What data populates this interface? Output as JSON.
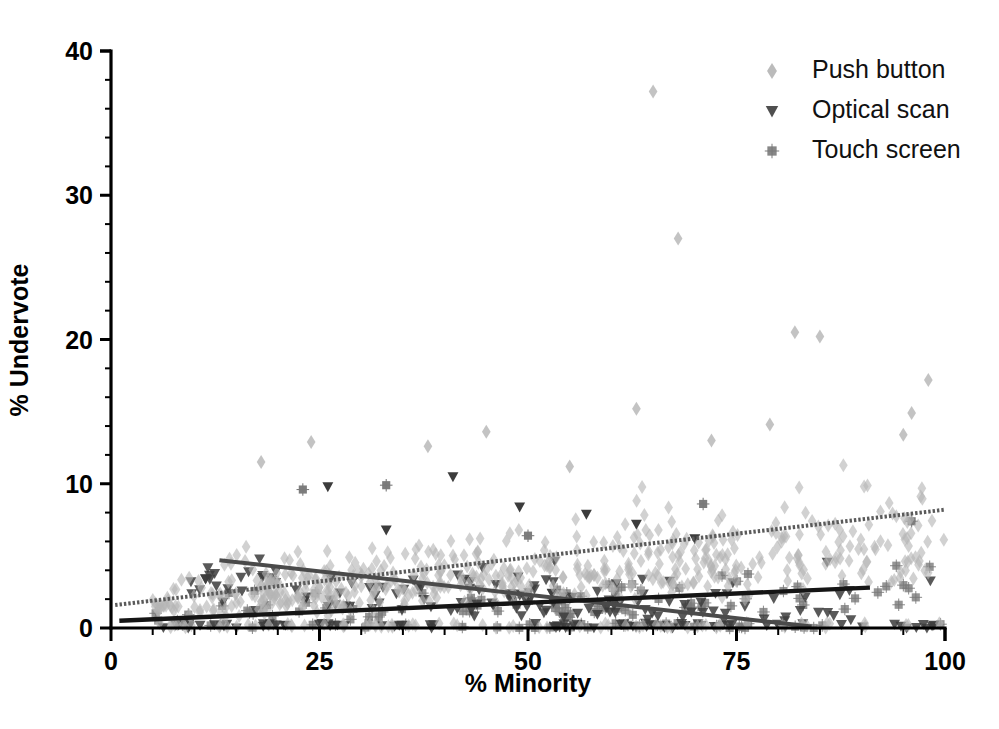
{
  "chart_data": {
    "type": "scatter",
    "title": "",
    "xlabel": "% Minority",
    "ylabel": "% Undervote",
    "xlim": [
      0,
      100
    ],
    "ylim": [
      0,
      40
    ],
    "xticks": [
      0,
      25,
      50,
      75,
      100
    ],
    "yticks": [
      0,
      10,
      20,
      30,
      40
    ],
    "xtick_labels": [
      "0",
      "25",
      "50",
      "75",
      "100"
    ],
    "ytick_labels": [
      "0",
      "10",
      "20",
      "30",
      "40"
    ],
    "grid": false,
    "legend_position": "top-right",
    "minor_ticks_per_interval": 4,
    "series": [
      {
        "name": "Push button",
        "marker": "diamond",
        "color": "#b4b4b4",
        "marker_size": 7,
        "point_count": 620,
        "trend": {
          "style": "dotted",
          "color": "#5a5a5a",
          "width": 4.0,
          "x_start": 0.5,
          "y_start": 1.6,
          "x_end": 100,
          "y_end": 8.2
        },
        "notable_points": [
          [
            65,
            37.2
          ],
          [
            68,
            27.0
          ],
          [
            82,
            20.5
          ],
          [
            85,
            20.2
          ],
          [
            98,
            17.2
          ],
          [
            63,
            15.2
          ],
          [
            96,
            14.9
          ],
          [
            79,
            14.1
          ],
          [
            72,
            13.0
          ],
          [
            24,
            12.9
          ],
          [
            38,
            12.6
          ],
          [
            45,
            13.6
          ],
          [
            18,
            11.5
          ],
          [
            95,
            13.4
          ],
          [
            55,
            11.2
          ]
        ]
      },
      {
        "name": "Optical scan",
        "marker": "triangle-down",
        "color": "#3c3c3c",
        "marker_size": 7,
        "point_count": 210,
        "trend": {
          "style": "solid",
          "color": "#4a4a4a",
          "width": 4.0,
          "x_start": 13,
          "y_start": 4.7,
          "x_end": 84,
          "y_end": 0.1
        },
        "notable_points": [
          [
            41,
            10.5
          ],
          [
            26,
            9.8
          ],
          [
            49,
            8.4
          ],
          [
            57,
            7.9
          ],
          [
            63,
            7.2
          ],
          [
            70,
            6.2
          ],
          [
            33,
            6.8
          ]
        ]
      },
      {
        "name": "Touch screen",
        "marker": "asterisk",
        "color": "#7a7a7a",
        "marker_size": 7,
        "point_count": 130,
        "trend": {
          "style": "solid",
          "color": "#151515",
          "width": 4.4,
          "x_start": 1.0,
          "y_start": 0.5,
          "x_end": 91,
          "y_end": 2.8
        },
        "notable_points": [
          [
            33,
            9.9
          ],
          [
            23,
            9.6
          ],
          [
            71,
            8.6
          ],
          [
            50,
            6.4
          ],
          [
            96,
            7.4
          ]
        ]
      }
    ],
    "legend": [
      {
        "label": "Push button",
        "marker": "diamond",
        "color": "#b4b4b4"
      },
      {
        "label": "Optical scan",
        "marker": "triangle-down",
        "color": "#3c3c3c"
      },
      {
        "label": "Touch screen",
        "marker": "asterisk",
        "color": "#7a7a7a"
      }
    ]
  },
  "colors": {
    "axis": "#000000",
    "background": "#ffffff",
    "push_button": "#b4b4b4",
    "optical_scan": "#3c3c3c",
    "touch_screen": "#7a7a7a",
    "trend_push": "#5a5a5a",
    "trend_optical": "#4a4a4a",
    "trend_touch": "#151515"
  }
}
